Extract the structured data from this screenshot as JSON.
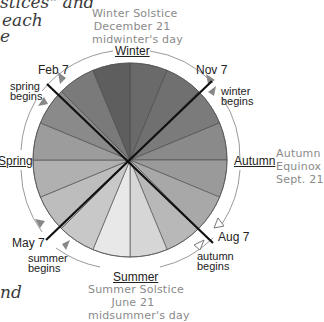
{
  "fragments": {
    "top_line1": "stices\" and",
    "top_line2": "each",
    "top_line3": "e",
    "bottom_line1": "nd"
  },
  "wheel": {
    "center": [
      130,
      160
    ],
    "radius": 97,
    "ring_radius": 108,
    "wedge_count": 16,
    "wedge_colors": [
      "#6a6a6a",
      "#707070",
      "#7b7b7b",
      "#8a8a8a",
      "#9a9a9a",
      "#a8a8a8",
      "#b8b8b8",
      "#d6d6d6",
      "#e8e8e8",
      "#c8c8c8",
      "#bdbdbd",
      "#b0b0b0",
      "#9c9c9c",
      "#8a8a8a",
      "#7a7a7a",
      "#5e5e5e"
    ]
  },
  "seasons": {
    "winter": "Winter",
    "spring": "Spring",
    "summer": "Summer",
    "autumn": "Autumn"
  },
  "solstices": {
    "winter": {
      "line1": "Winter Solstice",
      "line2": "December 21",
      "line3": "midwinter's day"
    },
    "summer": {
      "line1": "Summer Solstice",
      "line2": "June 21",
      "line3": "midsummer's day"
    },
    "autumn": {
      "line1": "Autumn",
      "line2": "Equinox",
      "line3": "Sept. 21"
    }
  },
  "cross_quarter": {
    "feb": {
      "date": "Feb 7",
      "label1": "spring",
      "label2": "begins"
    },
    "may": {
      "date": "May 7",
      "label1": "summer",
      "label2": "begins"
    },
    "aug": {
      "date": "Aug 7",
      "label1": "autumn",
      "label2": "begins"
    },
    "nov": {
      "date": "Nov 7",
      "label1": "winter",
      "label2": "begins"
    }
  }
}
